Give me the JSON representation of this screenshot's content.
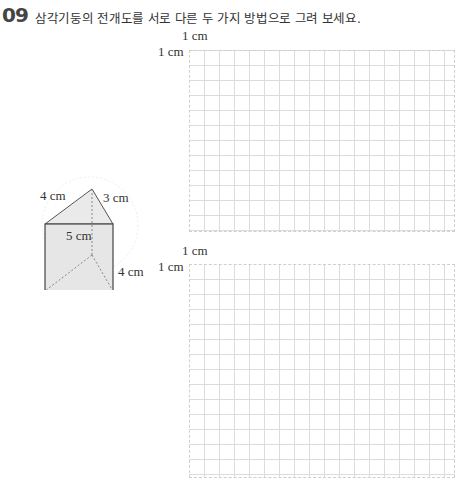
{
  "question": {
    "number": "09",
    "text": "삼각기둥의 전개도를 서로 다른 두 가지 방법으로 그려 보세요."
  },
  "prism": {
    "edge_left": "4 cm",
    "edge_right": "3 cm",
    "edge_base": "5 cm",
    "height": "4 cm"
  },
  "grids": [
    {
      "unit_top": "1 cm",
      "unit_left": "1 cm"
    },
    {
      "unit_top": "1 cm",
      "unit_left": "1 cm"
    }
  ],
  "colors": {
    "prism_fill": "#e8e8e8",
    "grid_line": "#dcdcdc",
    "edge": "#444444"
  }
}
